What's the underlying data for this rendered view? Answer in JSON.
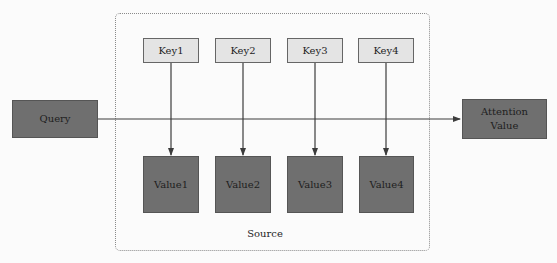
{
  "diagram": {
    "query": {
      "label": "Query"
    },
    "output": {
      "label_line1": "Attention",
      "label_line2": "Value"
    },
    "source": {
      "label": "Source",
      "keys": [
        {
          "label": "Key1"
        },
        {
          "label": "Key2"
        },
        {
          "label": "Key3"
        },
        {
          "label": "Key4"
        }
      ],
      "values": [
        {
          "label": "Value1"
        },
        {
          "label": "Value2"
        },
        {
          "label": "Value3"
        },
        {
          "label": "Value4"
        }
      ]
    },
    "colors": {
      "dark_box": "#6f6f6f",
      "key_box": "#e4e4e4",
      "line": "#3c3c3c",
      "frame": "#8a8a8a"
    }
  }
}
